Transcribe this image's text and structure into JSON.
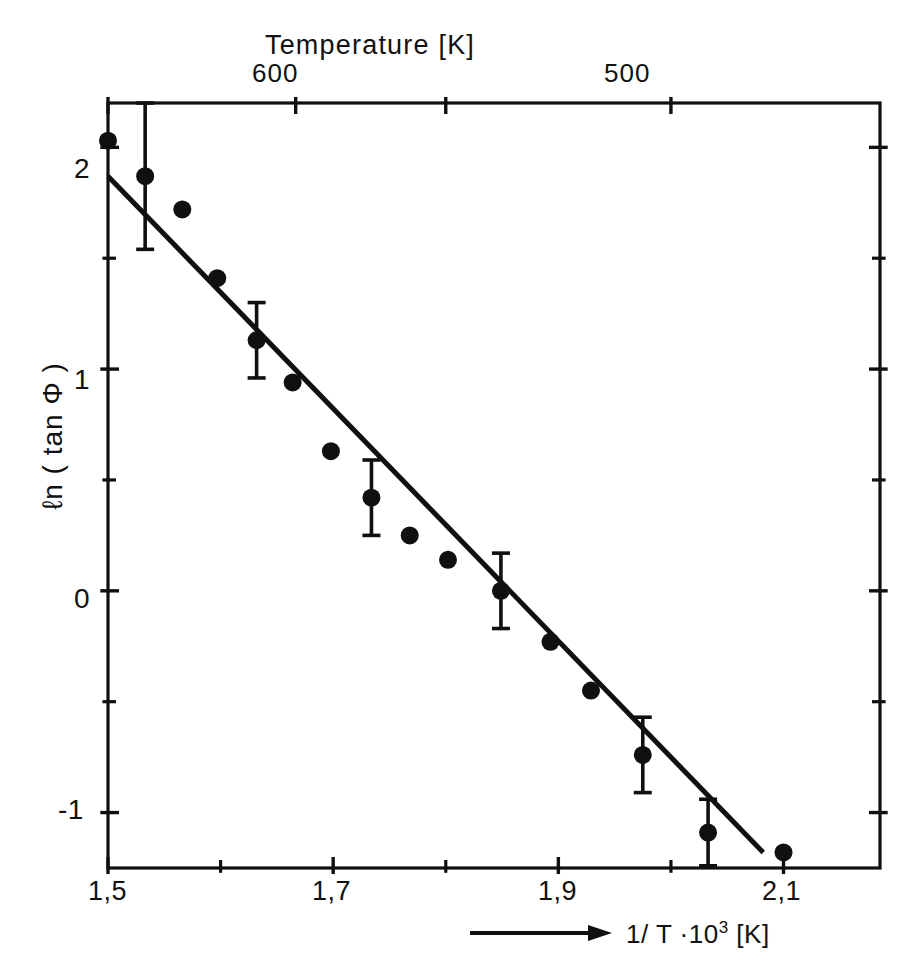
{
  "chart_data": {
    "type": "scatter",
    "title": "",
    "xlabel": "1/ T ·10³ [K]",
    "ylabel": "ℓn ( tan Φ )",
    "top_axis_label": "Temperature [K]",
    "xlim": [
      1.5,
      2.1857
    ],
    "ylim": [
      -1.25,
      2.2
    ],
    "grid": false,
    "legend": null,
    "x_ticks_major": [
      "1,5",
      "1,7",
      "1,9",
      "2,1"
    ],
    "x_tick_values_major": [
      1.5,
      1.7,
      1.9,
      2.1
    ],
    "x_tick_values_minor": [
      1.6,
      1.8,
      2.0
    ],
    "y_ticks_major": [
      "2",
      "1",
      "0",
      "-1"
    ],
    "y_tick_values_major": [
      2,
      1,
      0,
      -1
    ],
    "y_tick_values_minor": [
      1.5,
      0.5,
      -0.5
    ],
    "top_ticks": [
      "",
      "600",
      "",
      "500"
    ],
    "top_tick_values": [
      1.5,
      1.6667,
      1.8,
      2.0
    ],
    "top_tick_labels_shown": [
      "600",
      "500"
    ],
    "series": [
      {
        "name": "ln(tan phi) data",
        "marker": "filled-circle",
        "points": [
          {
            "x": 1.5,
            "y": 2.03,
            "yerr": 0.0
          },
          {
            "x": 1.533,
            "y": 1.87,
            "yerr": 0.33
          },
          {
            "x": 1.566,
            "y": 1.72,
            "yerr": 0.0
          },
          {
            "x": 1.597,
            "y": 1.41,
            "yerr": 0.0
          },
          {
            "x": 1.632,
            "y": 1.13,
            "yerr": 0.17
          },
          {
            "x": 1.664,
            "y": 0.94,
            "yerr": 0.0
          },
          {
            "x": 1.698,
            "y": 0.63,
            "yerr": 0.0
          },
          {
            "x": 1.734,
            "y": 0.42,
            "yerr": 0.17
          },
          {
            "x": 1.768,
            "y": 0.25,
            "yerr": 0.0
          },
          {
            "x": 1.802,
            "y": 0.14,
            "yerr": 0.0
          },
          {
            "x": 1.849,
            "y": 0.0,
            "yerr": 0.17
          },
          {
            "x": 1.893,
            "y": -0.23,
            "yerr": 0.0
          },
          {
            "x": 1.929,
            "y": -0.45,
            "yerr": 0.0
          },
          {
            "x": 1.975,
            "y": -0.74,
            "yerr": 0.17
          },
          {
            "x": 2.033,
            "y": -1.09,
            "yerr": 0.15
          },
          {
            "x": 2.1,
            "y": -1.18,
            "yerr": 0.0
          }
        ]
      }
    ],
    "fit_line": {
      "name": "linear fit",
      "x_start": 1.5,
      "y_start": 1.87,
      "x_end": 2.082,
      "y_end": -1.18,
      "slope": -5.24,
      "intercept": 9.73
    }
  },
  "axes": {
    "top_title": "Temperature [K]",
    "y_axis_label": "ℓn ( tan Φ )",
    "x_axis_label_prefix": "1/ T ·10",
    "x_axis_label_exponent": "3",
    "x_axis_label_suffix": " [K]",
    "top_tick_600": "600",
    "top_tick_500": "500",
    "y_tick_2": "2",
    "y_tick_1": "1",
    "y_tick_0": "0",
    "y_tick_minus1": "-1",
    "x_tick_15": "1,5",
    "x_tick_17": "1,7",
    "x_tick_19": "1,9",
    "x_tick_21": "2,1"
  },
  "style": {
    "ink": "#101010",
    "background": "#ffffff",
    "marker_radius": 9,
    "line_width": 5
  }
}
